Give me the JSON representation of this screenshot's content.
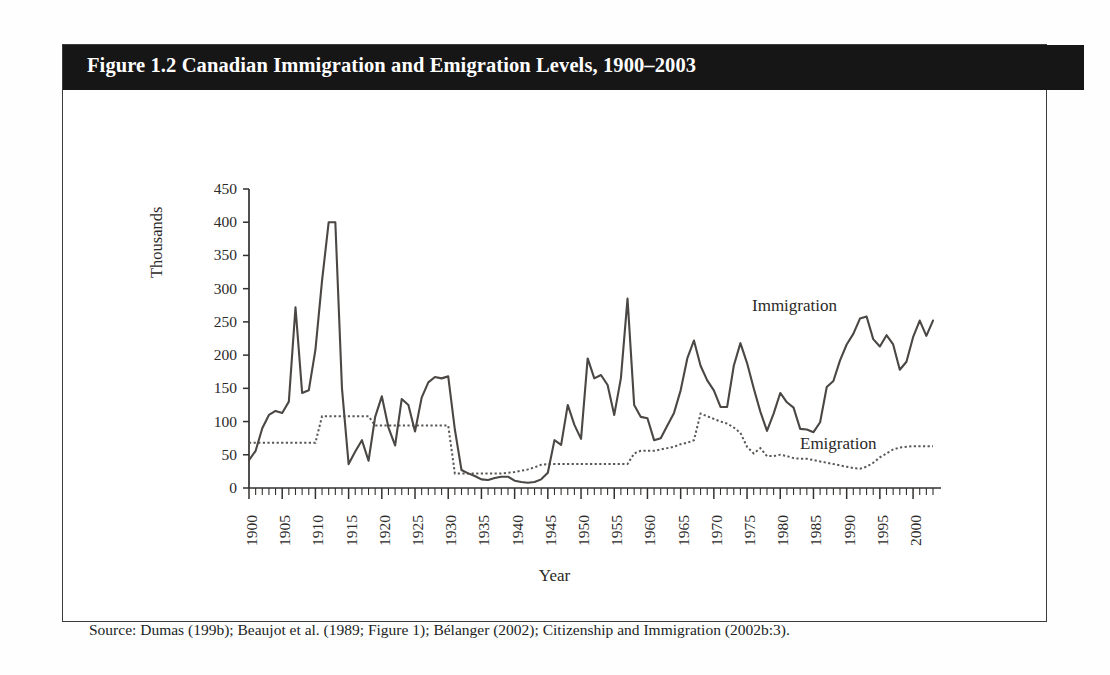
{
  "figure": {
    "title": "Figure 1.2 Canadian Immigration and Emigration Levels, 1900–2003",
    "source_note": "Source: Dumas (199b); Beaujot et al. (1989; Figure 1); Bélanger (2002); Citizenship and Immigration (2002b:3).",
    "title_bar_color": "#161616",
    "title_text_color": "#ffffff",
    "border_color": "#3b3b3b",
    "background_color": "#ffffff"
  },
  "chart_data": {
    "type": "line",
    "title": "Figure 1.2 Canadian Immigration and Emigration Levels, 1900–2003",
    "xlabel": "Year",
    "ylabel": "Thousands",
    "xlim": [
      1900,
      2003
    ],
    "ylim": [
      0,
      450
    ],
    "yticks": [
      0,
      50,
      100,
      150,
      200,
      250,
      300,
      350,
      400,
      450
    ],
    "xticks": [
      1900,
      1905,
      1910,
      1915,
      1920,
      1925,
      1930,
      1935,
      1940,
      1945,
      1950,
      1955,
      1960,
      1965,
      1970,
      1975,
      1980,
      1985,
      1990,
      1995,
      2000
    ],
    "x_tick_minor_step": 1,
    "grid": false,
    "legend": "inline-annotations",
    "annotations": [
      {
        "text": "Immigration",
        "near_year": 1984,
        "near_value": 272
      },
      {
        "text": "Emigration",
        "near_year": 1989,
        "near_value": 62
      }
    ],
    "x": [
      1900,
      1901,
      1902,
      1903,
      1904,
      1905,
      1906,
      1907,
      1908,
      1909,
      1910,
      1911,
      1912,
      1913,
      1914,
      1915,
      1916,
      1917,
      1918,
      1919,
      1920,
      1921,
      1922,
      1923,
      1924,
      1925,
      1926,
      1927,
      1928,
      1929,
      1930,
      1931,
      1932,
      1933,
      1934,
      1935,
      1936,
      1937,
      1938,
      1939,
      1940,
      1941,
      1942,
      1943,
      1944,
      1945,
      1946,
      1947,
      1948,
      1949,
      1950,
      1951,
      1952,
      1953,
      1954,
      1955,
      1956,
      1957,
      1958,
      1959,
      1960,
      1961,
      1962,
      1963,
      1964,
      1965,
      1966,
      1967,
      1968,
      1969,
      1970,
      1971,
      1972,
      1973,
      1974,
      1975,
      1976,
      1977,
      1978,
      1979,
      1980,
      1981,
      1982,
      1983,
      1984,
      1985,
      1986,
      1987,
      1988,
      1989,
      1990,
      1991,
      1992,
      1993,
      1994,
      1995,
      1996,
      1997,
      1998,
      1999,
      2000,
      2001,
      2002,
      2003
    ],
    "series": [
      {
        "name": "Immigration",
        "style": "solid",
        "color": "#4a4744",
        "values": [
          42,
          56,
          90,
          110,
          116,
          113,
          130,
          272,
          143,
          147,
          208,
          312,
          400,
          400,
          150,
          36,
          55,
          72,
          41,
          107,
          138,
          91,
          64,
          134,
          125,
          85,
          136,
          159,
          167,
          165,
          168,
          88,
          27,
          22,
          18,
          13,
          12,
          15,
          17,
          17,
          11,
          9,
          8,
          9,
          13,
          23,
          72,
          65,
          125,
          95,
          74,
          195,
          165,
          170,
          155,
          110,
          165,
          285,
          125,
          107,
          105,
          72,
          75,
          94,
          113,
          147,
          195,
          222,
          184,
          162,
          147,
          122,
          122,
          184,
          218,
          188,
          150,
          115,
          86,
          112,
          143,
          129,
          121,
          89,
          88,
          84,
          99,
          152,
          161,
          192,
          216,
          232,
          255,
          258,
          224,
          213,
          230,
          216,
          178,
          190,
          227,
          252,
          229,
          252
        ]
      },
      {
        "name": "Emigration",
        "style": "dotted",
        "color": "#5a5754",
        "values": [
          68,
          68,
          68,
          68,
          68,
          68,
          68,
          68,
          68,
          68,
          68,
          108,
          108,
          108,
          108,
          108,
          108,
          108,
          108,
          94,
          94,
          94,
          94,
          94,
          94,
          94,
          94,
          94,
          94,
          94,
          94,
          22,
          22,
          22,
          22,
          22,
          22,
          22,
          22,
          23,
          24,
          26,
          28,
          31,
          35,
          36,
          36,
          36,
          36,
          36,
          36,
          36,
          36,
          36,
          36,
          36,
          36,
          36,
          52,
          56,
          56,
          56,
          58,
          60,
          62,
          66,
          68,
          72,
          112,
          108,
          104,
          100,
          97,
          91,
          83,
          62,
          52,
          60,
          48,
          48,
          50,
          48,
          45,
          44,
          44,
          42,
          40,
          38,
          36,
          34,
          32,
          30,
          29,
          32,
          38,
          46,
          52,
          58,
          61,
          62,
          63,
          63,
          63,
          63
        ]
      }
    ]
  },
  "axes": {
    "y_tick_labels": [
      "450",
      "400",
      "350",
      "300",
      "250",
      "200",
      "150",
      "100",
      "50",
      "0"
    ],
    "x_tick_labels": [
      "1900",
      "1905",
      "1910",
      "1915",
      "1920",
      "1925",
      "1930",
      "1935",
      "1940",
      "1945",
      "1950",
      "1955",
      "1960",
      "1965",
      "1970",
      "1975",
      "1980",
      "1985",
      "1990",
      "1995",
      "2000"
    ],
    "y_axis_title": "Thousands",
    "x_axis_title": "Year"
  }
}
